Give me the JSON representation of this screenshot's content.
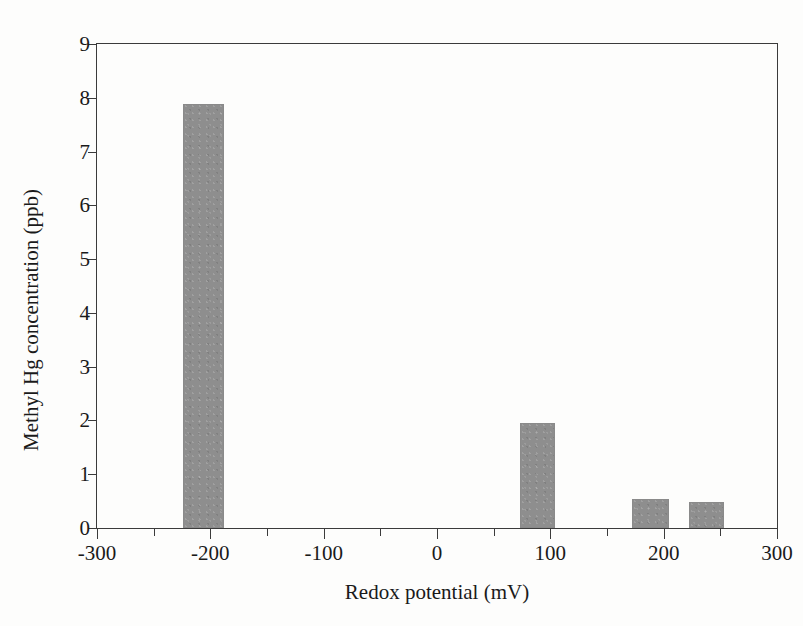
{
  "figure": {
    "background_color": "#fdfdfc",
    "frame_color": "#3b3b3b",
    "bar_color": "#8e8e8e"
  },
  "chart_data": {
    "type": "bar",
    "title": "",
    "subtitle": "",
    "xlabel": "Redox potential (mV)",
    "ylabel": "Methyl Hg concentration (ppb)",
    "xlim": [
      -300,
      300
    ],
    "ylim": [
      0,
      9
    ],
    "grid": false,
    "legend": null,
    "legend_position": "none",
    "x_tick_labels": [
      "-300",
      "-200",
      "-100",
      "0",
      "100",
      "200",
      "300"
    ],
    "x_tick_values": [
      -300,
      -200,
      -100,
      0,
      100,
      200,
      300
    ],
    "x_minor_tick_values": [
      -250,
      -150,
      -50,
      50,
      150,
      250
    ],
    "y_tick_labels": [
      "0",
      "1",
      "2",
      "3",
      "4",
      "5",
      "6",
      "7",
      "8",
      "9"
    ],
    "y_tick_values": [
      0,
      1,
      2,
      3,
      4,
      5,
      6,
      7,
      8,
      9
    ],
    "x": [
      -206,
      88,
      188,
      238
    ],
    "values": [
      7.88,
      1.95,
      0.54,
      0.48
    ],
    "bars": [
      {
        "label": "-206",
        "x_start": -224,
        "x_end": -188,
        "value": 7.88
      },
      {
        "label": "88",
        "x_start": 73,
        "x_end": 104,
        "value": 1.95
      },
      {
        "label": "188",
        "x_start": 172,
        "x_end": 205,
        "value": 0.54
      },
      {
        "label": "238",
        "x_start": 222,
        "x_end": 253,
        "value": 0.48
      }
    ],
    "annotations": []
  }
}
